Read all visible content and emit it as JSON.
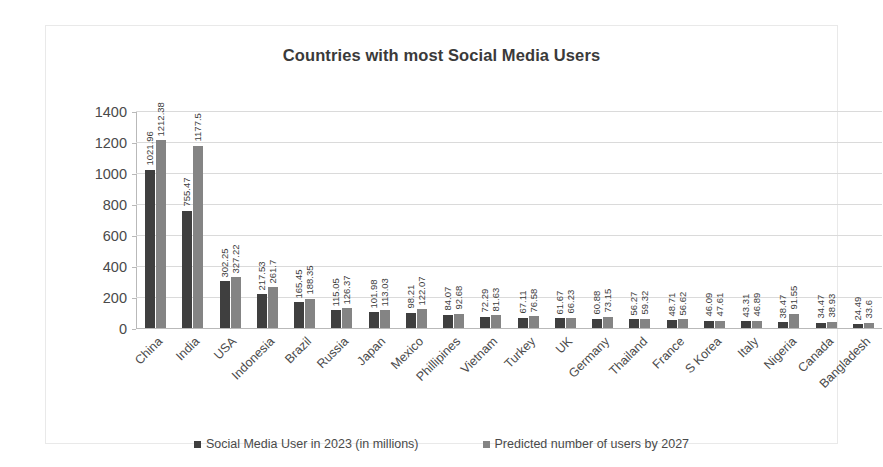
{
  "chart_data": {
    "type": "bar",
    "title": "Countries with most Social Media Users",
    "xlabel": "",
    "ylabel": "",
    "ylim": [
      0,
      1400
    ],
    "yticks": [
      0,
      200,
      400,
      600,
      800,
      1000,
      1200,
      1400
    ],
    "grid": true,
    "legend_position": "bottom",
    "categories": [
      "China",
      "India",
      "USA",
      "Indonesia",
      "Brazil",
      "Russia",
      "Japan",
      "Mexico",
      "Phillipines",
      "Vietnam",
      "Turkey",
      "UK",
      "Germany",
      "Thailand",
      "France",
      "S Korea",
      "Italy",
      "Nigeria",
      "Canada",
      "Bangladesh"
    ],
    "series": [
      {
        "name": "Social Media User in 2023 (in millions)",
        "color": "#3f3f3f",
        "values": [
          1021.96,
          755.47,
          302.25,
          217.53,
          165.45,
          115.05,
          101.98,
          98.21,
          84.07,
          72.29,
          67.11,
          61.67,
          60.88,
          56.27,
          48.71,
          46.09,
          43.31,
          38.47,
          34.47,
          24.49
        ],
        "labels": [
          "1021.96",
          "755.47",
          "302.25",
          "217.53",
          "165.45",
          "115.05",
          "101.98",
          "98.21",
          "84.07",
          "72.29",
          "67.11",
          "61.67",
          "60.88",
          "56.27",
          "48.71",
          "46.09",
          "43.31",
          "38.47",
          "34.47",
          "24.49"
        ]
      },
      {
        "name": "Predicted number of users by 2027",
        "color": "#848484",
        "values": [
          1212.38,
          1177.5,
          327.22,
          261.7,
          188.35,
          126.37,
          113.03,
          122.07,
          92.68,
          81.63,
          76.58,
          66.23,
          73.15,
          59.32,
          56.62,
          47.61,
          46.89,
          91.55,
          38.93,
          33.6
        ],
        "labels": [
          "1212.38",
          "1177.5",
          "327.22",
          "261.7",
          "188.35",
          "126.37",
          "113.03",
          "122.07",
          "92.68",
          "81.63",
          "76.58",
          "66.23",
          "73.15",
          "59.32",
          "56.62",
          "47.61",
          "46.89",
          "91.55",
          "38.93",
          "33.6"
        ]
      }
    ]
  },
  "legend": {
    "items": [
      {
        "label": "Social Media User in 2023 (in millions)"
      },
      {
        "label": "Predicted number of users by 2027"
      }
    ]
  }
}
